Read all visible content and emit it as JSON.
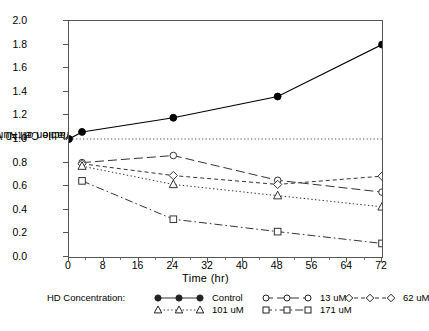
{
  "chart_data": {
    "type": "line",
    "title": "",
    "xlabel": "Time (hr)",
    "ylabel": "Viable Cell Number\nFraction of t=0 Value",
    "ylabel_line1": "Viable Cell Number",
    "ylabel_line2": "Fraction of t=0 Value",
    "xlim": [
      0,
      72
    ],
    "ylim": [
      0.0,
      2.0
    ],
    "xticks": [
      0,
      8,
      16,
      24,
      32,
      40,
      48,
      56,
      64,
      72
    ],
    "yticks": [
      "0.0",
      "0.2",
      "0.4",
      "0.6",
      "0.8",
      "1.0",
      "1.2",
      "1.4",
      "1.6",
      "1.8",
      "2.0"
    ],
    "grid": false,
    "reference_line": {
      "y": 1.0,
      "style": "dotted",
      "color": "#444444"
    },
    "legend_position": "below-axes",
    "legend_title": "HD Concentration:",
    "x": [
      0,
      3,
      24,
      48,
      72
    ],
    "series": [
      {
        "name": "Control",
        "label": "Control",
        "marker": "filled-circle",
        "line": "solid",
        "color": "#000000",
        "values": [
          1.0,
          1.06,
          1.18,
          1.36,
          1.8
        ]
      },
      {
        "name": "13 uM",
        "label": "13 uM",
        "marker": "open-circle",
        "line": "long-dash",
        "color": "#333333",
        "values": [
          null,
          0.8,
          0.86,
          0.65,
          0.55
        ]
      },
      {
        "name": "62 uM",
        "label": "62 uM",
        "marker": "open-diamond",
        "line": "short-dash",
        "color": "#333333",
        "values": [
          null,
          0.79,
          0.69,
          0.615,
          0.685
        ]
      },
      {
        "name": "101 uM",
        "label": "101 uM",
        "marker": "open-triangle",
        "line": "dotted",
        "color": "#333333",
        "values": [
          null,
          0.77,
          0.615,
          0.52,
          0.425
        ]
      },
      {
        "name": "171 uM",
        "label": "171 uM",
        "marker": "open-square",
        "line": "dash-dot",
        "color": "#333333",
        "values": [
          null,
          0.645,
          0.32,
          0.215,
          0.115
        ]
      }
    ]
  },
  "axes": {
    "xlabel": "Time (hr)",
    "ylabel_line1": "Viable Cell Number",
    "ylabel_line2": "Fraction of t=0 Value",
    "xticks": [
      "0",
      "8",
      "16",
      "24",
      "32",
      "40",
      "48",
      "56",
      "64",
      "72"
    ],
    "yticks": [
      "0.0",
      "0.2",
      "0.4",
      "0.6",
      "0.8",
      "1.0",
      "1.2",
      "1.4",
      "1.6",
      "1.8",
      "2.0"
    ]
  },
  "legend": {
    "title": "HD Concentration:",
    "entries": [
      {
        "label": "Control",
        "marker": "filled-circle",
        "line": "solid"
      },
      {
        "label": "13 uM",
        "marker": "open-circle",
        "line": "long-dash"
      },
      {
        "label": "62 uM",
        "marker": "open-diamond",
        "line": "short-dash"
      },
      {
        "label": "101 uM",
        "marker": "open-triangle",
        "line": "dotted"
      },
      {
        "label": "171 uM",
        "marker": "open-square",
        "line": "dash-dot"
      }
    ]
  }
}
